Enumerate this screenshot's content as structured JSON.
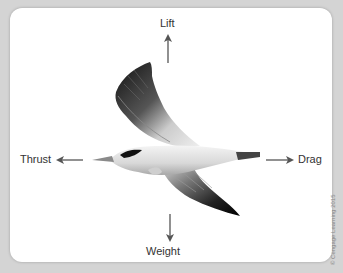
{
  "diagram": {
    "forces": {
      "lift": "Lift",
      "thrust": "Thrust",
      "drag": "Drag",
      "weight": "Weight"
    },
    "copyright": "© Cengage Learning 2015"
  },
  "colors": {
    "background": "#d4d4d4",
    "panel": "#ffffff",
    "arrow": "#555555",
    "text": "#333333"
  }
}
